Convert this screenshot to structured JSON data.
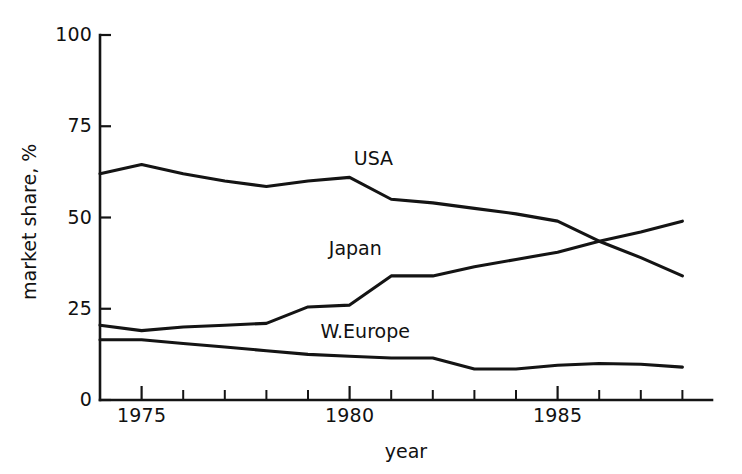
{
  "chart_data": {
    "type": "line",
    "title": "",
    "xlabel": "year",
    "ylabel": "market share, %",
    "xlim": [
      1974,
      1988
    ],
    "ylim": [
      0,
      100
    ],
    "grid": false,
    "legend": "inline-labels",
    "xticks_major": [
      1975,
      1980,
      1985
    ],
    "xtick_major_labels": [
      "1975",
      "1980",
      "1985"
    ],
    "xticks_minor": [
      1974,
      1976,
      1977,
      1978,
      1979,
      1981,
      1982,
      1983,
      1984,
      1986,
      1987,
      1988
    ],
    "yticks": [
      0,
      25,
      50,
      75,
      100
    ],
    "ytick_labels": [
      "0",
      "25",
      "50",
      "75",
      "100"
    ],
    "x": [
      1974,
      1975,
      1976,
      1977,
      1978,
      1979,
      1980,
      1981,
      1982,
      1983,
      1984,
      1985,
      1986,
      1987,
      1988
    ],
    "series": [
      {
        "name": "USA",
        "label": "USA",
        "color": "#141414",
        "values": [
          62,
          64.5,
          62,
          60,
          58.5,
          60,
          61,
          55,
          54,
          52.5,
          51,
          49,
          43.5,
          39,
          34
        ]
      },
      {
        "name": "Japan",
        "label": "Japan",
        "color": "#141414",
        "values": [
          20.5,
          19,
          20,
          20.5,
          21,
          25.5,
          26,
          34,
          34,
          36.5,
          38.5,
          40.5,
          43.5,
          46,
          49
        ]
      },
      {
        "name": "W.Europe",
        "label": "W.Europe",
        "color": "#141414",
        "values": [
          16.5,
          16.5,
          15.5,
          14.5,
          13.5,
          12.5,
          12,
          11.5,
          11.5,
          8.5,
          8.5,
          9.5,
          10,
          9.8,
          9
        ]
      }
    ],
    "annotations": [
      {
        "text": "USA",
        "x": 1980.1,
        "y": 66
      },
      {
        "text": "Japan",
        "x": 1979.5,
        "y": 41.5
      },
      {
        "text": "W.Europe",
        "x": 1979.3,
        "y": 18.5
      }
    ]
  }
}
